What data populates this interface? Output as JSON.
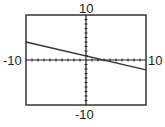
{
  "chart_data": {
    "type": "line",
    "title": "",
    "xlabel": "",
    "ylabel": "",
    "xlim": [
      -10,
      10
    ],
    "ylim": [
      -10,
      10
    ],
    "tick_labels": {
      "x_min": "-10",
      "x_max": "10",
      "y_min": "-10",
      "y_max": "10"
    },
    "x_tick_interval": 1,
    "y_tick_interval": 1,
    "grid": false,
    "series": [
      {
        "name": "line",
        "x": [
          -10,
          10
        ],
        "y": [
          4,
          -2.2
        ],
        "approx_equation": "y = -0.31x + 0.9"
      }
    ],
    "colors": {
      "frame": "#333333",
      "axes": "#222222",
      "line": "#333333"
    }
  }
}
